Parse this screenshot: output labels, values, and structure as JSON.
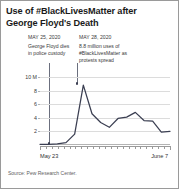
{
  "chart_data": {
    "type": "line",
    "title": "Use of #BlackLivesMatter after George Floyd's Death",
    "xlabel": "",
    "ylabel": "",
    "ylim": [
      0,
      10
    ],
    "yticks": [
      "10 M",
      "8",
      "6",
      "4",
      "2"
    ],
    "ytick_values": [
      10,
      8,
      6,
      4,
      2
    ],
    "grid": true,
    "legend": null,
    "x_axis_start_label": "May 23",
    "x_axis_end_label": "June 7",
    "x": [
      "May 23",
      "May 24",
      "May 25",
      "May 26",
      "May 27",
      "May 28",
      "May 29",
      "May 30",
      "May 31",
      "June 1",
      "June 2",
      "June 3",
      "June 4",
      "June 5",
      "June 6",
      "June 7"
    ],
    "values": [
      0.1,
      0.1,
      0.15,
      0.35,
      1.6,
      8.8,
      4.6,
      3.3,
      2.6,
      3.9,
      4.1,
      4.8,
      3.6,
      3.5,
      1.9,
      2.0
    ],
    "units": "millions of uses per day",
    "annotations": [
      {
        "date": "MAY 25, 2020",
        "text": "George Floyd dies in police custody",
        "x": "May 25",
        "y": 0.15
      },
      {
        "date": "MAY 28, 2020",
        "text": "8.8 million uses of #BlackLivesMatter as protests spread",
        "x": "May 28",
        "y": 8.8
      }
    ],
    "source": "Source: Pew Research Center.",
    "colors": {
      "line": "#3b3f52",
      "grid": "#dcdcdc",
      "axis": "#9a9a9a",
      "leader": "#6b6f7e",
      "text": "#1a1a1a"
    }
  }
}
